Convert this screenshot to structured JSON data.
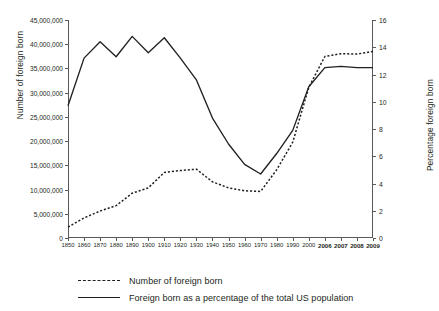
{
  "chart_data": {
    "type": "line",
    "title": "",
    "xlabel": "",
    "categories": [
      "1850",
      "1860",
      "1870",
      "1880",
      "1890",
      "1900",
      "1910",
      "1920",
      "1930",
      "1940",
      "1950",
      "1960",
      "1970",
      "1980",
      "1990",
      "2000",
      "2006",
      "2007",
      "2008",
      "2009"
    ],
    "grid": false,
    "legend_position": "bottom",
    "axes": {
      "left": {
        "label": "Number of foreign born",
        "ylim": [
          0,
          45000000
        ],
        "ticks": [
          0,
          5000000,
          10000000,
          15000000,
          20000000,
          25000000,
          30000000,
          35000000,
          40000000,
          45000000
        ],
        "tick_labels": [
          "0",
          "5,000,000",
          "10,000,000",
          "15,000,000",
          "20,000,000",
          "25,000,000",
          "30,000,000",
          "35,000,000",
          "40,000,000",
          "45,000,000"
        ]
      },
      "right": {
        "label": "Percentage foreign born",
        "ylim": [
          0,
          16
        ],
        "ticks": [
          0,
          2,
          4,
          6,
          8,
          10,
          12,
          14,
          16
        ],
        "tick_labels": [
          "0",
          "2",
          "4",
          "6",
          "8",
          "10",
          "12",
          "14",
          "16"
        ]
      }
    },
    "series": [
      {
        "name": "Number of foreign born",
        "style": "dotted",
        "axis": "left",
        "color": "#231f20",
        "values": [
          2240000,
          4140000,
          5570000,
          6680000,
          9250000,
          10340000,
          13520000,
          13920000,
          14200000,
          11590000,
          10350000,
          9740000,
          9620000,
          14080000,
          19770000,
          31100000,
          37470000,
          38050000,
          37960000,
          38520000
        ]
      },
      {
        "name": "Foreign born as a percentage of the total US population",
        "style": "solid",
        "axis": "right",
        "color": "#231f20",
        "values": [
          9.7,
          13.2,
          14.4,
          13.3,
          14.8,
          13.6,
          14.7,
          13.2,
          11.6,
          8.8,
          6.9,
          5.4,
          4.7,
          6.2,
          7.9,
          11.1,
          12.5,
          12.6,
          12.5,
          12.5
        ]
      }
    ]
  },
  "legend": {
    "entries": [
      {
        "label": "Number of foreign born",
        "style": "dotted"
      },
      {
        "label": "Foreign born as a percentage of the total US population",
        "style": "solid"
      }
    ]
  }
}
